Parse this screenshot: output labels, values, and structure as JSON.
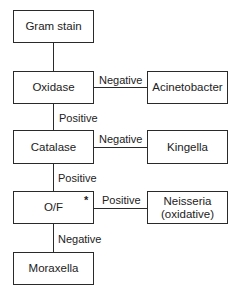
{
  "diagram": {
    "type": "flowchart",
    "nodes": {
      "gram_stain": "Gram stain",
      "oxidase": "Oxidase",
      "acinetobacter": "Acinetobacter",
      "catalase": "Catalase",
      "kingella": "Kingella",
      "of": "O/F",
      "of_marker": "*",
      "neisseria": "Neisseria (oxidative)",
      "moraxella": "Moraxella"
    },
    "edges": {
      "oxidase_to_acinetobacter": "Negative",
      "oxidase_to_catalase": "Positive",
      "catalase_to_kingella": "Negative",
      "catalase_to_of": "Positive",
      "of_to_neisseria": "Positive",
      "of_to_moraxella": "Negative"
    }
  }
}
